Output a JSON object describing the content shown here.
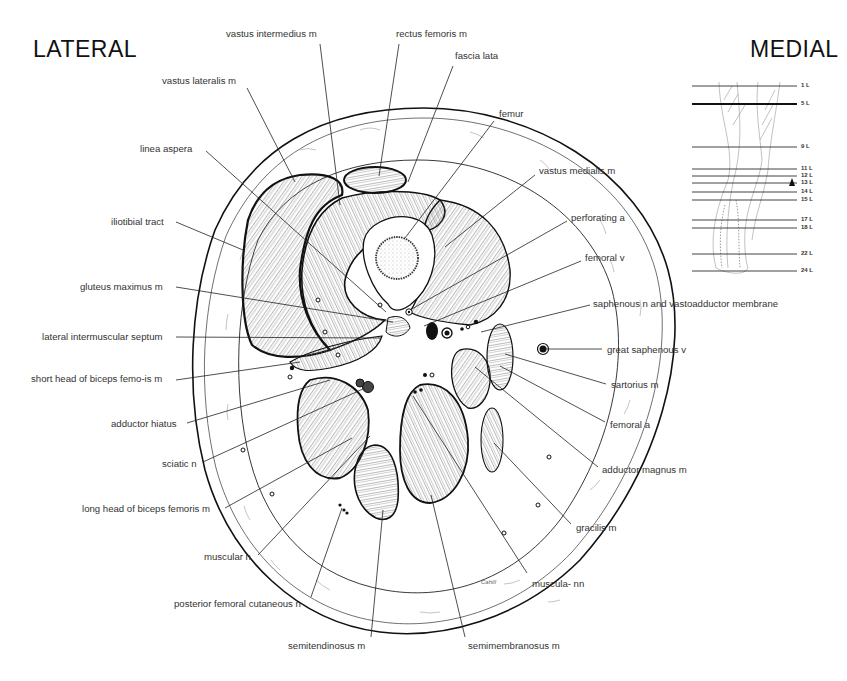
{
  "diagram": {
    "title_left": "LATERAL",
    "title_right": "MEDIAL",
    "artist_signature": "Cahill",
    "labels": [
      {
        "id": "vastus-intermedius-m",
        "text": "vastus intermedius m",
        "x": 226,
        "y": 28,
        "lx1": 320,
        "ly1": 44,
        "lx2": 340,
        "ly2": 205
      },
      {
        "id": "rectus-femoris-m",
        "text": "rectus femoris m",
        "x": 396,
        "y": 28,
        "lx1": 399,
        "ly1": 44,
        "lx2": 379,
        "ly2": 176
      },
      {
        "id": "fascia-lata",
        "text": "fascia lata",
        "x": 455,
        "y": 50,
        "lx1": 453,
        "ly1": 66,
        "lx2": 408,
        "ly2": 182
      },
      {
        "id": "vastus-lateralis-m",
        "text": "vastus lateralis m",
        "x": 162,
        "y": 75,
        "lx1": 247,
        "ly1": 88,
        "lx2": 295,
        "ly2": 182
      },
      {
        "id": "femur",
        "text": "femur",
        "x": 499,
        "y": 108,
        "lx1": 494,
        "ly1": 121,
        "lx2": 405,
        "ly2": 238
      },
      {
        "id": "linea-aspera",
        "text": "linea aspera",
        "x": 140,
        "y": 143,
        "lx1": 206,
        "ly1": 151,
        "lx2": 386,
        "ly2": 312
      },
      {
        "id": "vastus-medialis-m",
        "text": "vastus medialis m",
        "x": 539,
        "y": 165,
        "lx1": 535,
        "ly1": 175,
        "lx2": 445,
        "ly2": 247
      },
      {
        "id": "perforating-a",
        "text": "perforating a",
        "x": 571,
        "y": 212,
        "lx1": 567,
        "ly1": 221,
        "lx2": 410,
        "ly2": 310
      },
      {
        "id": "iliotibial-tract",
        "text": "iliotibial tract",
        "x": 111,
        "y": 216,
        "lx1": 176,
        "ly1": 222,
        "lx2": 243,
        "ly2": 250
      },
      {
        "id": "femoral-v",
        "text": "femoral v",
        "x": 585,
        "y": 252,
        "lx1": 581,
        "ly1": 261,
        "lx2": 424,
        "ly2": 326
      },
      {
        "id": "gluteus-maximus-m",
        "text": "gluteus maximus m",
        "x": 80,
        "y": 281,
        "lx1": 176,
        "ly1": 287,
        "lx2": 393,
        "ly2": 322
      },
      {
        "id": "saphenous-n-and-vastoadductor-membrane",
        "text": "saphenous n and vastoadductor membrane",
        "x": 593,
        "y": 298,
        "lx1": 590,
        "ly1": 305,
        "lx2": 481,
        "ly2": 332
      },
      {
        "id": "lateral-intermuscular-septum",
        "text": "lateral intermuscular septum",
        "x": 42,
        "y": 331,
        "lx1": 176,
        "ly1": 337,
        "lx2": 381,
        "ly2": 338
      },
      {
        "id": "great-saphenous-v",
        "text": "great saphenous v",
        "x": 607,
        "y": 344,
        "lx1": 602,
        "ly1": 349,
        "lx2": 545,
        "ly2": 349
      },
      {
        "id": "short-head-of-biceps-femoris-m",
        "text": "short head of biceps femo-is m",
        "x": 31,
        "y": 373,
        "lx1": 176,
        "ly1": 380,
        "lx2": 300,
        "ly2": 362
      },
      {
        "id": "sartorius-m",
        "text": "sartorius m",
        "x": 611,
        "y": 379,
        "lx1": 606,
        "ly1": 384,
        "lx2": 505,
        "ly2": 354
      },
      {
        "id": "adductor-hiatus",
        "text": "adductor hiatus",
        "x": 111,
        "y": 418,
        "lx1": 187,
        "ly1": 423,
        "lx2": 330,
        "ly2": 380
      },
      {
        "id": "femoral-a",
        "text": "femoral a",
        "x": 610,
        "y": 419,
        "lx1": 605,
        "ly1": 422,
        "lx2": 500,
        "ly2": 366
      },
      {
        "id": "sciatic-n",
        "text": "sciatic n",
        "x": 162,
        "y": 458,
        "lx1": 203,
        "ly1": 462,
        "lx2": 365,
        "ly2": 388
      },
      {
        "id": "adductor-magnus-m",
        "text": "adductor magnus m",
        "x": 602,
        "y": 464,
        "lx1": 598,
        "ly1": 467,
        "lx2": 475,
        "ly2": 367
      },
      {
        "id": "long-head-of-biceps-femoris-m",
        "text": "long head of biceps femoris m",
        "x": 82,
        "y": 503,
        "lx1": 225,
        "ly1": 508,
        "lx2": 352,
        "ly2": 438
      },
      {
        "id": "gracilis-m",
        "text": "gracilis m",
        "x": 576,
        "y": 522,
        "lx1": 571,
        "ly1": 524,
        "lx2": 494,
        "ly2": 443
      },
      {
        "id": "muscular-n",
        "text": "muscular n",
        "x": 204,
        "y": 551,
        "lx1": 258,
        "ly1": 555,
        "lx2": 370,
        "ly2": 436
      },
      {
        "id": "muscular-nn",
        "text": "muscula- nn",
        "x": 532,
        "y": 578,
        "lx1": 527,
        "ly1": 573,
        "lx2": 413,
        "ly2": 396
      },
      {
        "id": "posterior-femoral-cutaneous-n",
        "text": "posterior femoral cutaneous n",
        "x": 174,
        "y": 598,
        "lx1": 311,
        "ly1": 597,
        "lx2": 342,
        "ly2": 508
      },
      {
        "id": "semitendinosus-m",
        "text": "semitendinosus m",
        "x": 288,
        "y": 640,
        "lx1": 371,
        "ly1": 637,
        "lx2": 383,
        "ly2": 510
      },
      {
        "id": "semimembranosus-m",
        "text": "semimembranosus m",
        "x": 468,
        "y": 640,
        "lx1": 465,
        "ly1": 637,
        "lx2": 431,
        "ly2": 495
      }
    ]
  },
  "level_inset": {
    "indicator": "arrow-up",
    "current_level": "5 L",
    "levels": [
      {
        "label": "1 L",
        "y": 86,
        "bold": false
      },
      {
        "label": "5 L",
        "y": 104,
        "bold": true
      },
      {
        "label": "9 L",
        "y": 147,
        "bold": false
      },
      {
        "label": "11 L",
        "y": 169,
        "bold": false
      },
      {
        "label": "12 L",
        "y": 176,
        "bold": false
      },
      {
        "label": "13 L",
        "y": 183,
        "bold": false
      },
      {
        "label": "14 L",
        "y": 192,
        "bold": false
      },
      {
        "label": "15 L",
        "y": 200,
        "bold": false
      },
      {
        "label": "17 L",
        "y": 220,
        "bold": false
      },
      {
        "label": "18 L",
        "y": 228,
        "bold": false
      },
      {
        "label": "22 L",
        "y": 254,
        "bold": false
      },
      {
        "label": "24 L",
        "y": 271,
        "bold": false
      }
    ]
  },
  "colors": {
    "ink": "#111111",
    "label_text": "#333333",
    "background": "#ffffff"
  }
}
